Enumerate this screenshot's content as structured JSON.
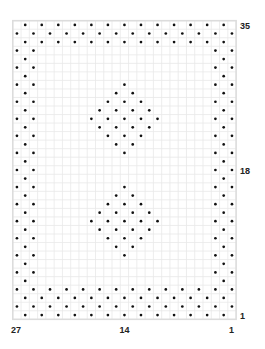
{
  "chart_data": {
    "type": "dot-grid-chart",
    "title": "",
    "grid": {
      "columns": 27,
      "rows": 35,
      "gridlines": true
    },
    "column_numbering": "right-to-left",
    "row_numbering": "bottom-to-top",
    "row_labels": [
      {
        "row": 35,
        "text": "35",
        "side": "right"
      },
      {
        "row": 18,
        "text": "18",
        "side": "right"
      },
      {
        "row": 1,
        "text": "1",
        "side": "right"
      }
    ],
    "column_labels": [
      {
        "col": 27,
        "text": "27"
      },
      {
        "col": 14,
        "text": "14"
      },
      {
        "col": 1,
        "text": "1"
      }
    ],
    "regions": [
      {
        "name": "border",
        "rule": "dot where (row+col) is odd",
        "rows_bottom": [
          1,
          4
        ],
        "rows_top": [
          33,
          35
        ],
        "cols_right": [
          1,
          3
        ],
        "cols_left": [
          25,
          27
        ]
      },
      {
        "name": "upper-diamond",
        "rule": "dot where (row+col) is even and |col-14|+|row-24| <= 4",
        "center": {
          "col": 14,
          "row": 24
        },
        "radius": 4
      },
      {
        "name": "lower-diamond",
        "rule": "dot where (row+col) is even and |col-14|+|row-12| <= 4",
        "center": {
          "col": 14,
          "row": 12
        },
        "radius": 4
      }
    ],
    "colors": {
      "dot": "#111111",
      "gridline": "#e9e9e9",
      "frame": "#dcdcdc",
      "background": "#ffffff"
    }
  },
  "labels": {
    "row_top": "35",
    "row_mid": "18",
    "row_bottom": "1",
    "col_left": "27",
    "col_mid": "14",
    "col_right": "1"
  }
}
